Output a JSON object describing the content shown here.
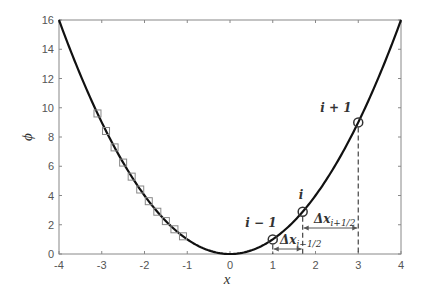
{
  "chart_data": {
    "type": "line",
    "title": "",
    "xlabel": "x",
    "ylabel": "ϕ",
    "xlim": [
      -4,
      4
    ],
    "ylim": [
      0,
      16
    ],
    "xticks": [
      -4,
      -3,
      -2,
      -1,
      0,
      1,
      2,
      3,
      4
    ],
    "yticks": [
      0,
      2,
      4,
      6,
      8,
      10,
      12,
      14,
      16
    ],
    "grid": false,
    "legend": null,
    "series": [
      {
        "name": "phi = x^2",
        "kind": "line",
        "function": "x^2",
        "color": "#111111",
        "x": [
          -4,
          -3,
          -2,
          -1,
          0,
          1,
          2,
          3,
          4
        ],
        "values": [
          16,
          9,
          4,
          1,
          0,
          1,
          4,
          9,
          16
        ]
      },
      {
        "name": "square markers",
        "kind": "scatter",
        "marker": "square",
        "color": "#888888",
        "x": [
          -3.1,
          -2.9,
          -2.7,
          -2.5,
          -2.3,
          -2.1,
          -1.9,
          -1.7,
          -1.5,
          -1.3,
          -1.1
        ],
        "values": [
          9.61,
          8.41,
          7.29,
          6.25,
          5.29,
          4.41,
          3.61,
          2.89,
          2.25,
          1.69,
          1.21
        ]
      },
      {
        "name": "grid nodes",
        "kind": "scatter",
        "marker": "circle",
        "color": "#333333",
        "x": [
          1,
          1.7,
          3
        ],
        "values": [
          1,
          2.89,
          9
        ],
        "labels": [
          "i − 1",
          "i",
          "i + 1"
        ]
      }
    ],
    "annotations": [
      {
        "text": "Δx",
        "subscript": "i+1/2",
        "from_x": 1.7,
        "to_x": 3,
        "y_px": 228
      },
      {
        "text": "Δx",
        "subscript": "i−1/2",
        "from_x": 1,
        "to_x": 1.7,
        "y_px": 249
      }
    ]
  },
  "labels": {
    "xlabel": "x",
    "ylabel": "ϕ",
    "node_prev": "i − 1",
    "node_cur": "i",
    "node_next": "i + 1",
    "dx_main": "Δx",
    "dx_next_sub": "i+1/2",
    "dx_prev_sub": "i−1/2"
  }
}
